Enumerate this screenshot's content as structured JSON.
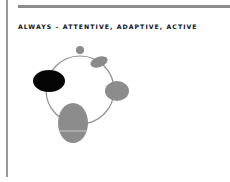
{
  "slide": {
    "title": "ALWAYS – ATTENTIVE, ADAPTIVE, ACTIVE"
  },
  "diagram": {
    "ring": {
      "cx": 80,
      "cy": 90,
      "r": 34,
      "color": "#8e8e8e"
    },
    "nodes": [
      {
        "name": "small-dot",
        "cx": 80,
        "cy": 50,
        "rx": 4,
        "ry": 4,
        "rotate": 0,
        "color": "#8a8a8a"
      },
      {
        "name": "tilted-ellipse",
        "cx": 99,
        "cy": 62,
        "rx": 9,
        "ry": 5,
        "rotate": -20,
        "color": "#8a8a8a"
      },
      {
        "name": "black-ellipse",
        "cx": 49,
        "cy": 81,
        "rx": 16,
        "ry": 11,
        "rotate": 0,
        "color": "#050505"
      },
      {
        "name": "right-ellipse",
        "cx": 117,
        "cy": 91,
        "rx": 12,
        "ry": 10,
        "rotate": 0,
        "color": "#8c8c8c"
      },
      {
        "name": "large-ellipse",
        "cx": 73,
        "cy": 123,
        "rx": 15,
        "ry": 20,
        "rotate": 0,
        "color": "#8c8c8c"
      }
    ]
  }
}
